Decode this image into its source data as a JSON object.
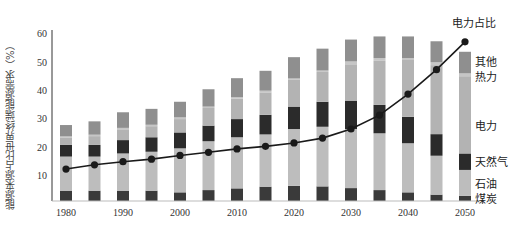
{
  "chart_data": {
    "type": "bar",
    "stacked": true,
    "title": "",
    "xlabel": "",
    "ylabel": "能源来源占比世界终端能源需求（%）",
    "ylim": [
      0,
      60
    ],
    "yticks": [
      10,
      20,
      30,
      40,
      50,
      60
    ],
    "xtick_labels": [
      "1980",
      "1990",
      "2000",
      "2010",
      "2020",
      "2030",
      "2040",
      "2050"
    ],
    "grid": false,
    "categories": [
      "1980",
      "1985",
      "1990",
      "1995",
      "2000",
      "2005",
      "2010",
      "2015",
      "2020",
      "2025",
      "2030",
      "2035",
      "2040",
      "2045",
      "2050"
    ],
    "series": [
      {
        "name": "煤炭",
        "color": "#3a3a3a",
        "values": [
          4.7,
          4.7,
          4.7,
          4.7,
          4.1,
          4.9,
          5.5,
          6.1,
          6.4,
          6.2,
          5.6,
          4.9,
          4.1,
          3.3,
          2.9
        ]
      },
      {
        "name": "石油",
        "color": "#bdbdbd",
        "values": [
          12.0,
          12.0,
          13.1,
          13.7,
          15.5,
          17.2,
          18.0,
          18.4,
          20.0,
          21.0,
          20.8,
          20.0,
          17.3,
          13.7,
          9.1
        ]
      },
      {
        "name": "天然气",
        "color": "#2b2b2b",
        "values": [
          4.1,
          4.1,
          4.7,
          5.1,
          5.6,
          5.5,
          6.4,
          6.9,
          7.9,
          8.8,
          10.0,
          10.0,
          9.3,
          7.6,
          5.8
        ]
      },
      {
        "name": "电力",
        "color": "#b3b3b3",
        "values": [
          2.5,
          3.1,
          3.8,
          3.9,
          4.7,
          6.2,
          7.2,
          7.9,
          9.4,
          10.5,
          12.8,
          15.5,
          20.0,
          24.3,
          27.2
        ]
      },
      {
        "name": "热力",
        "color": "#c6c6c6",
        "values": [
          0.5,
          0.5,
          0.5,
          0.5,
          0.6,
          0.5,
          0.5,
          0.6,
          0.5,
          0.5,
          1.0,
          1.0,
          0.7,
          1.0,
          1.0
        ]
      },
      {
        "name": "其他",
        "color": "#8f8f8f",
        "values": [
          4.0,
          4.7,
          5.5,
          5.6,
          5.5,
          6.1,
          6.7,
          7.0,
          7.5,
          7.7,
          7.7,
          7.6,
          7.6,
          7.4,
          7.6
        ]
      }
    ],
    "line_series": {
      "name": "电力占比",
      "color": "#1a1a1a",
      "values": [
        12.3,
        13.8,
        14.9,
        15.8,
        17.1,
        18.2,
        19.4,
        20.3,
        21.5,
        23.2,
        26.4,
        31.3,
        38.7,
        47.3,
        57.1
      ]
    },
    "legend": {
      "position": "right, inline labels next to 2050 bar",
      "entries": [
        "其他",
        "热力",
        "电力",
        "天然气",
        "石油",
        "煤炭"
      ]
    },
    "annotations": [
      {
        "text": "电力占比",
        "at": "2050 line end"
      }
    ]
  },
  "labels": {
    "ylabel": "能源来源占比世界终端能源需求（%）",
    "line_label": "电力占比",
    "legend_other": "其他",
    "legend_heat": "热力",
    "legend_electricity": "电力",
    "legend_gas": "天然气",
    "legend_oil": "石油",
    "legend_coal": "煤炭"
  }
}
